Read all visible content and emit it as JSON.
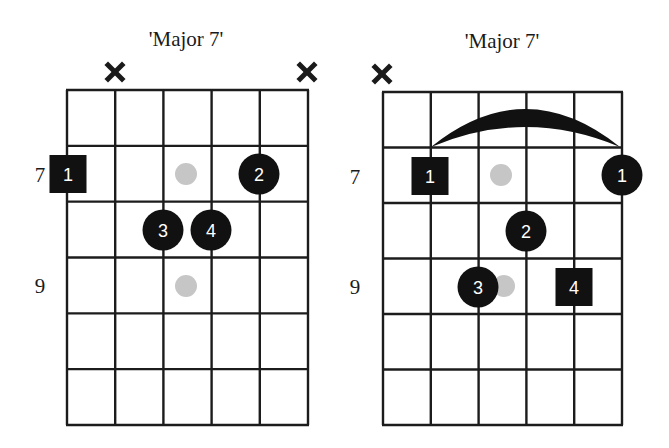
{
  "colors": {
    "background": "#ffffff",
    "grid": "#1c1c1c",
    "finger_fill": "#111111",
    "finger_text": "#ffffff",
    "root_dot": "#c6c6c6"
  },
  "diagrams": [
    {
      "title": "'Major 7'",
      "title_x": 186,
      "title_y": 46,
      "grid": {
        "x0": 67,
        "y0": 90,
        "x1": 308,
        "y1": 425,
        "strings": 6,
        "frets": 6
      },
      "fret_labels": [
        {
          "text": "7",
          "x": 40,
          "y": 182
        },
        {
          "text": "9",
          "x": 40,
          "y": 293
        }
      ],
      "muted": [
        {
          "x": 115,
          "y": 72
        },
        {
          "x": 307,
          "y": 72
        }
      ],
      "root_dots": [
        {
          "x": 186,
          "y": 174
        },
        {
          "x": 186,
          "y": 286
        }
      ],
      "fingers": [
        {
          "label": "1",
          "shape": "square",
          "x": 68,
          "y": 174
        },
        {
          "label": "2",
          "shape": "circle",
          "x": 259,
          "y": 174
        },
        {
          "label": "3",
          "shape": "circle",
          "x": 163,
          "y": 230
        },
        {
          "label": "4",
          "shape": "circle",
          "x": 211,
          "y": 230
        }
      ],
      "barre": null
    },
    {
      "title": "'Major 7'",
      "title_x": 502,
      "title_y": 48,
      "grid": {
        "x0": 383,
        "y0": 92,
        "x1": 622,
        "y1": 425,
        "strings": 6,
        "frets": 6
      },
      "fret_labels": [
        {
          "text": "7",
          "x": 355,
          "y": 184
        },
        {
          "text": "9",
          "x": 355,
          "y": 294
        }
      ],
      "muted": [
        {
          "x": 382,
          "y": 74
        }
      ],
      "root_dots": [
        {
          "x": 501,
          "y": 175
        },
        {
          "x": 504,
          "y": 286
        }
      ],
      "fingers": [
        {
          "label": "1",
          "shape": "square",
          "x": 430,
          "y": 176
        },
        {
          "label": "1",
          "shape": "circle",
          "x": 622,
          "y": 175
        },
        {
          "label": "2",
          "shape": "circle",
          "x": 526,
          "y": 231
        },
        {
          "label": "3",
          "shape": "circle",
          "x": 478,
          "y": 287
        },
        {
          "label": "4",
          "shape": "square",
          "x": 574,
          "y": 287
        }
      ],
      "barre": {
        "x_start": 431,
        "x_end": 620,
        "y_base": 147,
        "y_peak_outer": 109,
        "y_peak_inner": 127
      }
    }
  ]
}
